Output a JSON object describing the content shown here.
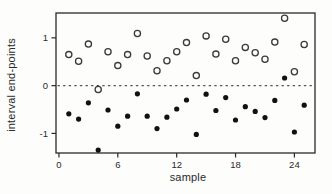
{
  "figure": {
    "background": "#fdfdfc",
    "ink_color": "#2a2a2a",
    "marker_open_color": "#3a3a3a",
    "marker_filled_color": "#111111"
  },
  "chart_data": {
    "type": "scatter",
    "title": "",
    "xlabel": "sample",
    "ylabel": "interval end-points",
    "xlim": [
      -0.3,
      26.1
    ],
    "ylim": [
      -1.41,
      1.52
    ],
    "x_ticks": [
      0,
      6,
      12,
      18,
      24
    ],
    "x_tick_labels": [
      "0",
      "6",
      "12",
      "18",
      "24"
    ],
    "y_ticks": [
      -1,
      0,
      1
    ],
    "y_tick_labels": [
      "-1",
      "0",
      "1"
    ],
    "grid": false,
    "legend": "none",
    "zero_line": {
      "y": 0,
      "style": "dotted"
    },
    "x": [
      1,
      2,
      3,
      4,
      5,
      6,
      7,
      8,
      9,
      10,
      11,
      12,
      13,
      14,
      15,
      16,
      17,
      18,
      19,
      20,
      21,
      22,
      23,
      24,
      25
    ],
    "series": [
      {
        "name": "upper end-point",
        "marker": "open-circle",
        "values": [
          0.65,
          0.51,
          0.87,
          -0.08,
          0.71,
          0.42,
          0.65,
          1.09,
          0.62,
          0.31,
          0.52,
          0.71,
          0.9,
          0.21,
          1.04,
          0.66,
          0.97,
          0.52,
          0.8,
          0.69,
          0.55,
          0.91,
          1.41,
          0.29,
          0.86
        ]
      },
      {
        "name": "lower end-point",
        "marker": "filled-circle",
        "values": [
          -0.59,
          -0.7,
          -0.36,
          -1.35,
          -0.51,
          -0.85,
          -0.64,
          -0.17,
          -0.64,
          -0.9,
          -0.66,
          -0.49,
          -0.3,
          -1.02,
          -0.18,
          -0.52,
          -0.25,
          -0.72,
          -0.44,
          -0.54,
          -0.67,
          -0.31,
          0.16,
          -0.97,
          -0.41
        ]
      }
    ]
  }
}
